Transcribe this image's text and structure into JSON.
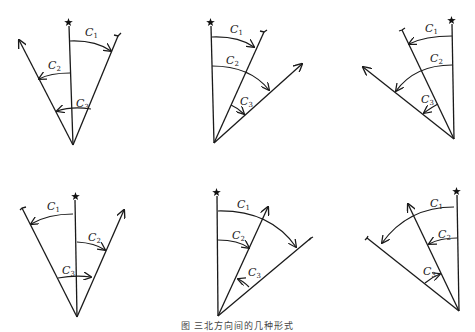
{
  "figure": {
    "caption": "图 三北方向间的几种形式",
    "labels": {
      "c1": "C",
      "c2": "C",
      "c3": "C",
      "s1": "1",
      "s2": "2",
      "s3": "3"
    },
    "legend_semantics": {
      "star_line": "true north",
      "fork_line": "grid north",
      "arrow_line": "magnetic north"
    },
    "diagrams": [
      {
        "id": 1,
        "position": "top-left"
      },
      {
        "id": 2,
        "position": "top-center"
      },
      {
        "id": 3,
        "position": "top-right"
      },
      {
        "id": 4,
        "position": "bottom-left"
      },
      {
        "id": 5,
        "position": "bottom-center"
      },
      {
        "id": 6,
        "position": "bottom-right"
      }
    ]
  }
}
